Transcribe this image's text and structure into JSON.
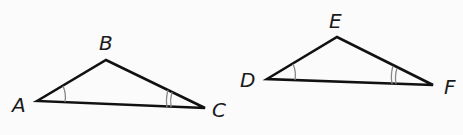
{
  "diagram": {
    "type": "similar-triangles",
    "colors": {
      "stroke": "#111111",
      "arc": "#888888",
      "background": "#fbfbfb"
    },
    "triangles": [
      {
        "name": "ABC",
        "vertices": {
          "A": {
            "label": "A",
            "x": 37,
            "y": 101,
            "lx": 12,
            "ly": 112
          },
          "B": {
            "label": "B",
            "x": 106,
            "y": 60,
            "lx": 99,
            "ly": 50
          },
          "C": {
            "label": "C",
            "x": 205,
            "y": 108,
            "lx": 212,
            "ly": 117
          }
        },
        "angle_marks": [
          {
            "vertex": "A",
            "arcs": 1
          },
          {
            "vertex": "C",
            "arcs": 2
          }
        ]
      },
      {
        "name": "DEF",
        "vertices": {
          "D": {
            "label": "D",
            "x": 267,
            "y": 79,
            "lx": 240,
            "ly": 87
          },
          "E": {
            "label": "E",
            "x": 337,
            "y": 37,
            "lx": 329,
            "ly": 28
          },
          "F": {
            "label": "F",
            "x": 433,
            "y": 85,
            "lx": 444,
            "ly": 94
          }
        },
        "angle_marks": [
          {
            "vertex": "D",
            "arcs": 1
          },
          {
            "vertex": "F",
            "arcs": 2
          }
        ]
      }
    ]
  }
}
